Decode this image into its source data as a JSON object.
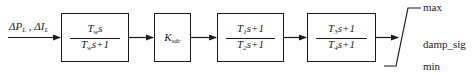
{
  "input": {
    "label_parts": [
      {
        "main": "ΔP",
        "sub": "L"
      },
      {
        "sep": " , "
      },
      {
        "main": "ΔI",
        "sub": "L"
      }
    ]
  },
  "blocks": [
    {
      "id": "washout",
      "type": "transfer_function",
      "numerator": {
        "T": "T",
        "sub": "w",
        "rest": "s"
      },
      "denominator": {
        "T": "T",
        "sub": "w",
        "rest": "s+1"
      }
    },
    {
      "id": "gain",
      "type": "gain",
      "symbol": "K",
      "sub": "sdc"
    },
    {
      "id": "lead-lag-1",
      "type": "transfer_function",
      "numerator": {
        "T": "T",
        "sub": "1",
        "rest": "s+1"
      },
      "denominator": {
        "T": "T",
        "sub": "2",
        "rest": "s+1"
      }
    },
    {
      "id": "lead-lag-2",
      "type": "transfer_function",
      "numerator": {
        "T": "T",
        "sub": "3",
        "rest": "s+1"
      },
      "denominator": {
        "T": "T",
        "sub": "4",
        "rest": "s+1"
      }
    }
  ],
  "limiter": {
    "max_label": "max",
    "output_label": "damp_sig",
    "min_label": "min"
  },
  "colors": {
    "line": "#1a1a1a",
    "background": "#ffffff"
  }
}
